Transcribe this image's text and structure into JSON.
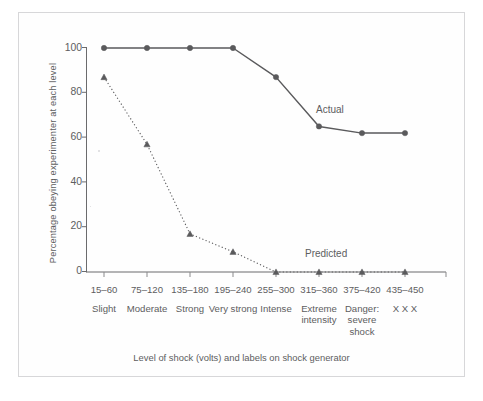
{
  "figure": {
    "background_color": "#ffffff",
    "frame_border_color": "#d7d7d9",
    "ink_color": "#58585a",
    "line_color": "#5a5a5c"
  },
  "chart_data": {
    "type": "line",
    "title": "",
    "xlabel": "Level of shock (volts) and labels on shock generator",
    "ylabel": "Percentage obeying experimenter at each level",
    "categories": [
      "15–60",
      "75–120",
      "135–180",
      "195–240",
      "255–300",
      "315–360",
      "375–420",
      "435–450"
    ],
    "category_descriptions": [
      "Slight",
      "Moderate",
      "Strong",
      "Very strong",
      "Intense",
      "Extreme intensity",
      "Danger: severe shock",
      "X X X"
    ],
    "ylim": [
      0,
      100
    ],
    "yticks": [
      0,
      20,
      40,
      60,
      80,
      100
    ],
    "ytick_labels": [
      "0",
      "20",
      "40",
      "60",
      "80",
      "100"
    ],
    "grid": false,
    "legend_position": "inline-annotation",
    "series": [
      {
        "name": "Actual",
        "values": [
          100,
          100,
          100,
          100,
          87,
          65,
          62,
          62
        ],
        "line_style": "solid",
        "marker": "circle",
        "color": "#5a5a5c"
      },
      {
        "name": "Predicted",
        "values": [
          87,
          57,
          17,
          9,
          0,
          0,
          0,
          0
        ],
        "line_style": "dotted",
        "marker": "triangle",
        "color": "#5a5a5c"
      }
    ],
    "annotations": [
      {
        "text": "Actual",
        "series": "Actual"
      },
      {
        "text": "Predicted",
        "series": "Predicted"
      }
    ]
  },
  "axis": {
    "y_title": "Percentage obeying experimenter at each level",
    "x_title": "Level of shock (volts) and labels on shock generator",
    "y_tick_0": "0",
    "y_tick_20": "20",
    "y_tick_40": "40",
    "y_tick_60": "60",
    "y_tick_80": "80",
    "y_tick_100": "100"
  },
  "x_categories": [
    {
      "volts": "15–60",
      "descr": "Slight"
    },
    {
      "volts": "75–120",
      "descr": "Moderate"
    },
    {
      "volts": "135–180",
      "descr": "Strong"
    },
    {
      "volts": "195–240",
      "descr": "Very\nstrong"
    },
    {
      "volts": "255–300",
      "descr": "Intense"
    },
    {
      "volts": "315–360",
      "descr": "Extreme\nintensity"
    },
    {
      "volts": "375–420",
      "descr": "Danger:\nsevere\nshock"
    },
    {
      "volts": "435–450",
      "descr": "X X X"
    }
  ],
  "annotations": {
    "actual": "Actual",
    "predicted": "Predicted"
  }
}
